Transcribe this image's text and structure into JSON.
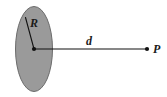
{
  "figure": {
    "type": "physics-diagram",
    "background_color": "#ffffff",
    "width": 167,
    "height": 97
  },
  "disk": {
    "name": "charged-disk",
    "shape": "ellipse",
    "fill_color": "#9a9a9a",
    "stroke_color": "#6b6b6b",
    "center_x": 34,
    "center_y": 49,
    "radius_x": 18.5,
    "radius_y": 42.5
  },
  "center_point": {
    "name": "disk-center",
    "x": 34,
    "y": 49,
    "color": "#111111",
    "radius": 2.1
  },
  "radius_line": {
    "name": "radius-segment",
    "x1": 34,
    "y1": 49,
    "x2": 25.5,
    "y2": 17.5,
    "color": "#111111",
    "width": 1.1
  },
  "axis_line": {
    "name": "axis-segment",
    "x1": 34,
    "y1": 49,
    "x2": 147,
    "y2": 49,
    "color": "#111111",
    "width": 1.2
  },
  "field_point": {
    "name": "field-point-P",
    "x": 147,
    "y": 49,
    "color": "#111111",
    "radius": 2.1
  },
  "labels": {
    "radius": {
      "text": "R",
      "x": 34,
      "y": 27,
      "meaning": "disk radius"
    },
    "distance": {
      "text": "d",
      "x": 89,
      "y": 45,
      "meaning": "distance from disk center to point P"
    },
    "point": {
      "text": "P",
      "x": 153,
      "y": 53,
      "meaning": "field point"
    }
  }
}
